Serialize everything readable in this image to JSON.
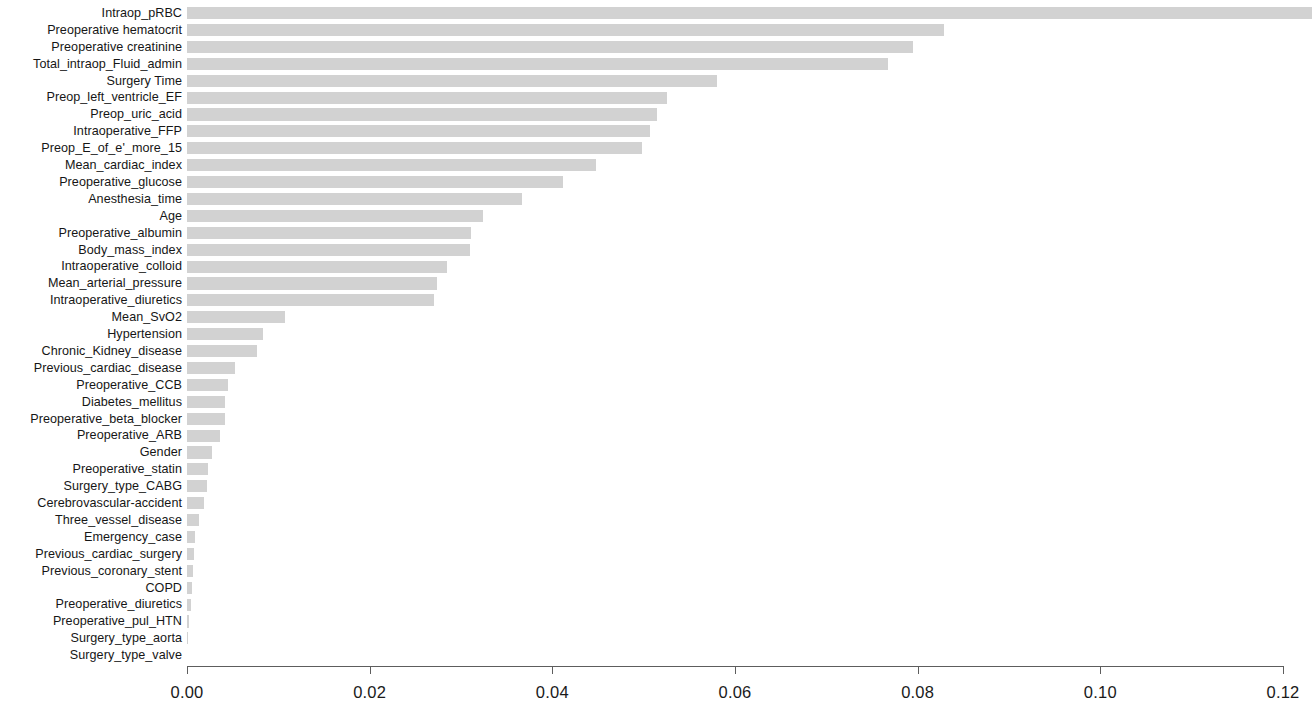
{
  "chart_data": {
    "type": "bar",
    "orientation": "horizontal",
    "title": "",
    "subtitle": "",
    "xlabel": "",
    "ylabel": "",
    "xlim": [
      0.0,
      0.12
    ],
    "xticks": [
      "0.00",
      "0.02",
      "0.04",
      "0.06",
      "0.08",
      "0.10",
      "0.12"
    ],
    "xtick_values": [
      0.0,
      0.02,
      0.04,
      0.06,
      0.08,
      0.1,
      0.12
    ],
    "grid": false,
    "legend": null,
    "bar_color": "#d2d2d2",
    "axis_color": "#5d5d5d",
    "text_color": "#1a1a1a",
    "categories": [
      "Intraop_pRBC",
      "Preoperative hematocrit",
      "Preoperative creatinine",
      "Total_intraop_Fluid_admin",
      "Surgery Time",
      "Preop_left_ventricle_EF",
      "Preop_uric_acid",
      "Intraoperative_FFP",
      "Preop_E_of_e'_more_15",
      "Mean_cardiac_index",
      "Preoperative_glucose",
      "Anesthesia_time",
      "Age",
      "Preoperative_albumin",
      "Body_mass_index",
      "Intraoperative_colloid",
      "Mean_arterial_pressure",
      "Intraoperative_diuretics",
      "Mean_SvO2",
      "Hypertension",
      "Chronic_Kidney_disease",
      "Previous_cardiac_disease",
      "Preoperative_CCB",
      "Diabetes_mellitus",
      "Preoperative_beta_blocker",
      "Preoperative_ARB",
      "Gender",
      "Preoperative_statin",
      "Surgery_type_CABG",
      "Cerebrovascular-accident",
      "Three_vessel_disease",
      "Emergency_case",
      "Previous_cardiac_surgery",
      "Previous_coronary_stent",
      "COPD",
      "Preoperative_diuretics",
      "Preoperative_pul_HTN",
      "Surgery_type_aorta",
      "Surgery_type_valve"
    ],
    "values": [
      0.1232,
      0.0829,
      0.0795,
      0.0767,
      0.058,
      0.0526,
      0.0515,
      0.0507,
      0.0498,
      0.0448,
      0.0412,
      0.0367,
      0.0324,
      0.0311,
      0.031,
      0.0285,
      0.0274,
      0.027,
      0.0107,
      0.0083,
      0.0077,
      0.0053,
      0.0045,
      0.0042,
      0.0042,
      0.0036,
      0.0027,
      0.0023,
      0.0022,
      0.0019,
      0.0013,
      0.0009,
      0.0008,
      0.0007,
      0.0005,
      0.0004,
      0.0002,
      0.0001,
      0.0
    ]
  }
}
